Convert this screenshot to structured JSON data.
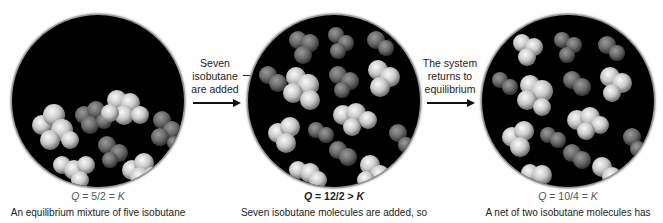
{
  "panels": [
    {
      "q_expression": {
        "q": "Q",
        "rel": " = 5/2 = ",
        "k": "K"
      },
      "caption": "An equilibrium mixture of five isobutane",
      "molecule_counts": {
        "isobutane": 5,
        "butane": 2
      }
    },
    {
      "q_expression": {
        "q": "Q",
        "rel": " = 12/2 > ",
        "k": "K"
      },
      "caption": "Seven isobutane molecules are added, so",
      "molecule_counts": {
        "isobutane": 12,
        "butane": 2
      }
    },
    {
      "q_expression": {
        "q": "Q",
        "rel": " = 10/4 = ",
        "k": "K"
      },
      "caption": "A net of two isobutane molecules has",
      "molecule_counts": {
        "isobutane": 10,
        "butane": 4
      }
    }
  ],
  "transitions": [
    {
      "lines": [
        "Seven",
        "isobutane",
        "are added"
      ]
    },
    {
      "lines": [
        "The system",
        "returns to",
        "equilibrium"
      ]
    }
  ],
  "colors": {
    "flask_bg": "#000000",
    "isobutane_light": "#d8d8d8",
    "butane_dark": "#6e6e6e",
    "text": "#222222",
    "q_label": "#555555"
  }
}
